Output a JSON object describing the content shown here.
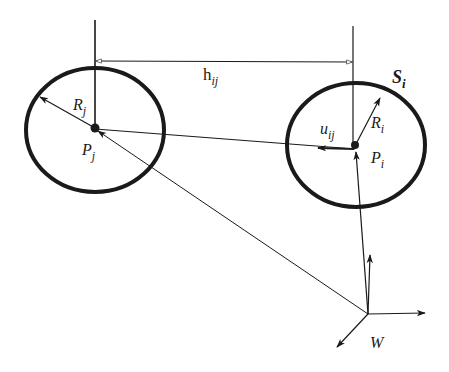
{
  "diagram": {
    "type": "geometric-vector-diagram",
    "background": "#ffffff",
    "ink_color": "#1a1a1a",
    "labels": {
      "h": {
        "base": "h",
        "sub": "ij"
      },
      "R_j": {
        "base": "R",
        "sub": "j"
      },
      "P_j": {
        "base": "P",
        "sub": "j"
      },
      "S_i": {
        "base": "S",
        "sub": "i"
      },
      "R_i": {
        "base": "R",
        "sub": "i"
      },
      "u_ij": {
        "base": "u",
        "sub": "ij"
      },
      "P_i": {
        "base": "P",
        "sub": "i"
      },
      "W": {
        "base": "W"
      }
    },
    "shapes": {
      "circle_j": {
        "cx": 95,
        "cy": 130,
        "rx": 69,
        "ry": 62,
        "label": "S_j (unlabeled)"
      },
      "circle_i": {
        "cx": 356,
        "cy": 145,
        "rx": 69,
        "ry": 62,
        "label": "S_i"
      },
      "world_origin": {
        "x": 368,
        "y": 314,
        "label": "W"
      }
    },
    "vectors": [
      {
        "name": "h_ij",
        "from": "vertical line at P_i",
        "to": "vertical line at P_j",
        "style": "thin, hollow arrowheads both ends"
      },
      {
        "name": "R_j",
        "from": "P_j",
        "to": "circle_j edge (upper-left)"
      },
      {
        "name": "R_i",
        "from": "P_i",
        "to": "circle_i edge (upper-right)"
      },
      {
        "name": "u_ij",
        "from": "P_i",
        "direction": "towards P_j",
        "style": "bold short arrow"
      },
      {
        "name": "P_j",
        "from": "W",
        "to": "P_j"
      },
      {
        "name": "P_i",
        "from": "W",
        "to": "P_i"
      },
      {
        "name": "W-x-axis",
        "from": "W",
        "direction": "right"
      },
      {
        "name": "W-y-axis",
        "from": "W",
        "direction": "up"
      },
      {
        "name": "W-z-axis",
        "from": "W",
        "direction": "down-left"
      }
    ]
  }
}
